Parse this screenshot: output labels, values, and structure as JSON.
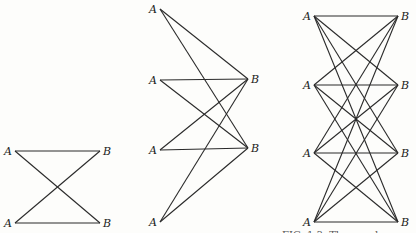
{
  "figure": {
    "graphs": [
      {
        "name": "K2,2",
        "left_label": "A",
        "right_label": "B",
        "left_nodes": [
          [
            15,
            151
          ],
          [
            15,
            223
          ]
        ],
        "right_nodes": [
          [
            100,
            151
          ],
          [
            100,
            223
          ]
        ]
      },
      {
        "name": "K4,2",
        "left_label": "A",
        "right_label": "B",
        "left_nodes": [
          [
            160,
            9
          ],
          [
            160,
            80
          ],
          [
            160,
            150
          ],
          [
            160,
            222
          ]
        ],
        "right_nodes": [
          [
            248,
            79
          ],
          [
            248,
            148
          ]
        ]
      },
      {
        "name": "K4,4",
        "left_label": "A",
        "right_label": "B",
        "left_nodes": [
          [
            314,
            16
          ],
          [
            314,
            85
          ],
          [
            314,
            153
          ],
          [
            314,
            222
          ]
        ],
        "right_nodes": [
          [
            398,
            16
          ],
          [
            398,
            85
          ],
          [
            398,
            153
          ],
          [
            398,
            222
          ]
        ]
      }
    ],
    "caption_fragment": "FIG. 1.3.  The graphs"
  }
}
